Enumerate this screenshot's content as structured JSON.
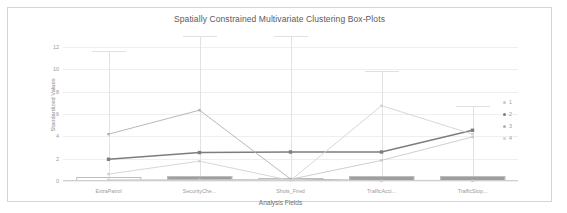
{
  "chart_data": {
    "type": "line",
    "title": "Spatially Constrained Multivariate Clustering Box-Plots",
    "xlabel": "Analysis Fields",
    "ylabel": "Standardized Values",
    "categories": [
      "ExtraPatrol",
      "SecurityChe...",
      "Shots_Fired",
      "TrafficAcci...",
      "TrafficStop..."
    ],
    "ylim": [
      0,
      13
    ],
    "yticks": [
      0,
      2,
      4,
      6,
      8,
      10,
      12
    ],
    "ytick_labels": [
      "0",
      "2",
      "4",
      "6",
      "8",
      "10",
      "12"
    ],
    "grid": true,
    "legend_position": "right",
    "series": [
      {
        "name": "1",
        "color": "#c8c8c8",
        "values": [
          0.1,
          0.12,
          0.15,
          1.85,
          3.95
        ]
      },
      {
        "name": "2",
        "color": "#7d7d7d",
        "values": [
          1.95,
          2.55,
          2.6,
          2.6,
          4.55
        ]
      },
      {
        "name": "3",
        "color": "#b0b0b0",
        "values": [
          4.2,
          6.35,
          0.18,
          0.05,
          0.05
        ]
      },
      {
        "name": "4",
        "color": "#d2d2d2",
        "values": [
          0.62,
          1.78,
          0.05,
          6.75,
          4.2
        ]
      }
    ],
    "boxplots": [
      {
        "category": "ExtraPatrol",
        "whisker_high": 11.65,
        "whisker_low": 0.0,
        "box_top": 0.35,
        "box_bottom": 0.0,
        "median": 0.12,
        "filled": false
      },
      {
        "category": "SecurityChe...",
        "whisker_high": 13.0,
        "whisker_low": 0.0,
        "box_top": 0.45,
        "box_bottom": 0.0,
        "median": 0.15,
        "filled": true
      },
      {
        "category": "Shots_Fired",
        "whisker_high": 13.0,
        "whisker_low": 0.0,
        "box_top": 0.3,
        "box_bottom": 0.0,
        "median": 0.1,
        "filled": false
      },
      {
        "category": "TrafficAcci...",
        "whisker_high": 9.85,
        "whisker_low": 0.0,
        "box_top": 0.45,
        "box_bottom": 0.0,
        "median": 0.15,
        "filled": true
      },
      {
        "category": "TrafficStop...",
        "whisker_high": 6.75,
        "whisker_low": 0.0,
        "box_top": 0.45,
        "box_bottom": 0.0,
        "median": 0.15,
        "filled": true
      }
    ]
  },
  "legend": {
    "items": [
      {
        "label": "1",
        "color": "#c8c8c8"
      },
      {
        "label": "2",
        "color": "#7d7d7d"
      },
      {
        "label": "3",
        "color": "#b0b0b0"
      },
      {
        "label": "4",
        "color": "#d2d2d2"
      }
    ]
  }
}
